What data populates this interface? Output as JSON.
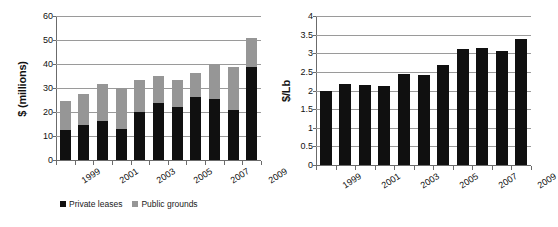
{
  "chart_data": [
    {
      "type": "bar",
      "id": "revenue-stacked",
      "title": "",
      "xlabel": "",
      "ylabel": "$ (millions)",
      "ylim": [
        0,
        60
      ],
      "yticks": [
        0,
        10,
        20,
        30,
        40,
        50,
        60
      ],
      "ytick_labels": [
        "0",
        "10",
        "20",
        "30",
        "40",
        "50",
        "60"
      ],
      "grid": true,
      "stacked": true,
      "legend_position": "bottom",
      "categories": [
        "1999",
        "2000",
        "2001",
        "2002",
        "2003",
        "2004",
        "2005",
        "2006",
        "2007",
        "2008",
        "2009"
      ],
      "tick_labels_shown": [
        "1999",
        "",
        "2001",
        "",
        "2003",
        "",
        "2005",
        "",
        "2007",
        "",
        "2009"
      ],
      "series": [
        {
          "name": "Private leases",
          "color": "#101010",
          "values": [
            12.7,
            14.4,
            16.1,
            13.0,
            20.0,
            23.6,
            22.2,
            26.1,
            25.3,
            21.0,
            38.9
          ]
        },
        {
          "name": "Public grounds",
          "color": "#969696",
          "values": [
            11.7,
            13.1,
            15.7,
            17.0,
            13.3,
            11.4,
            11.1,
            10.1,
            14.8,
            17.9,
            12.1
          ]
        }
      ],
      "totals": [
        24.4,
        27.5,
        31.8,
        30.0,
        33.3,
        35.0,
        33.3,
        36.2,
        40.1,
        38.9,
        51.0
      ]
    },
    {
      "type": "bar",
      "id": "price-per-lb",
      "title": "",
      "xlabel": "",
      "ylabel": "$/Lb",
      "ylim": [
        0,
        4
      ],
      "yticks": [
        0,
        0.5,
        1,
        1.5,
        2,
        2.5,
        3,
        3.5,
        4
      ],
      "ytick_labels": [
        "0",
        "0.5",
        "1",
        "1.5",
        "2",
        "2.5",
        "3",
        "3.5",
        "4"
      ],
      "grid": true,
      "stacked": false,
      "legend_position": "none",
      "categories": [
        "1999",
        "2000",
        "2001",
        "2002",
        "2003",
        "2004",
        "2005",
        "2006",
        "2007",
        "2008",
        "2009"
      ],
      "tick_labels_shown": [
        "1999",
        "",
        "2001",
        "",
        "2003",
        "",
        "2005",
        "",
        "2007",
        "",
        "2009"
      ],
      "series": [
        {
          "name": "Price",
          "color": "#101010",
          "values": [
            2.0,
            2.17,
            2.16,
            2.12,
            2.45,
            2.42,
            2.68,
            3.12,
            3.13,
            3.05,
            3.39
          ]
        }
      ]
    }
  ],
  "legend": {
    "items": [
      {
        "label": "Private leases",
        "color": "#101010"
      },
      {
        "label": "Public grounds",
        "color": "#969696"
      }
    ]
  }
}
